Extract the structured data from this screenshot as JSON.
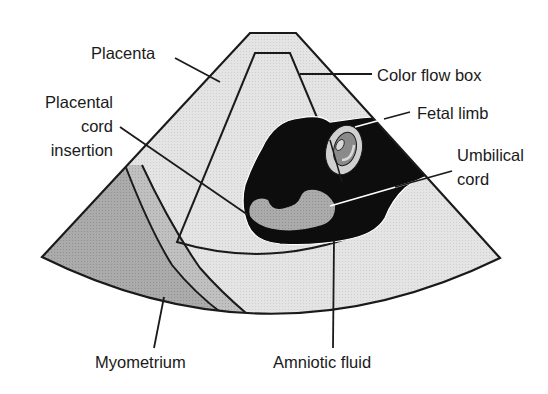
{
  "diagram": {
    "colors": {
      "placenta_fill": "#e2e2e2",
      "myometrium_fill": "#a9a9a9",
      "myometrium_band": "#bdbdbd",
      "fluid_fill": "#0d0d0d",
      "cord_fill": "#8a8a8a",
      "limb_fill": "#cfcfcf",
      "outline": "#1a1a1a"
    },
    "labels": {
      "placenta": "Placenta",
      "color_flow_box": "Color flow box",
      "placental_cord_insertion_line1": "Placental",
      "placental_cord_insertion_line2": "cord",
      "placental_cord_insertion_line3": "insertion",
      "fetal_limb": "Fetal limb",
      "umbilical_cord_line1": "Umbilical",
      "umbilical_cord_line2": "cord",
      "myometrium": "Myometrium",
      "amniotic_fluid": "Amniotic fluid"
    }
  }
}
